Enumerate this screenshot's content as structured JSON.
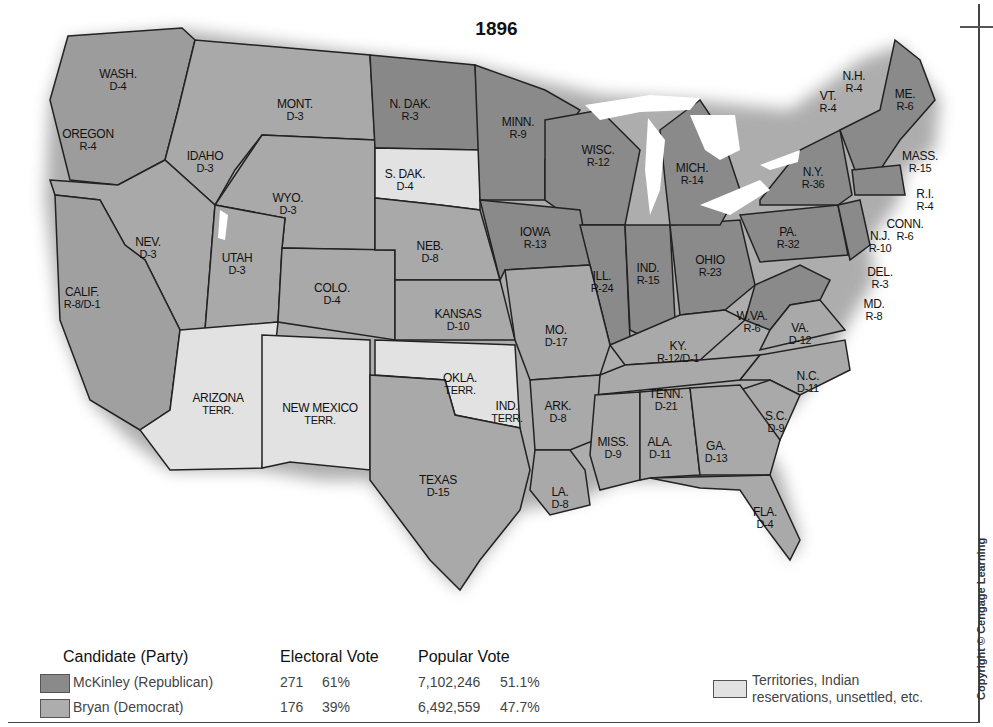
{
  "title": "1896",
  "colors": {
    "republican": "#8a8a8a",
    "democrat": "#adadad",
    "territory": "#e2e2e2",
    "lakes": "#ffffff"
  },
  "states": [
    {
      "name": "WASH.",
      "vote": "D-4",
      "x": 118,
      "y": 68
    },
    {
      "name": "OREGON",
      "vote": "R-4",
      "x": 88,
      "y": 128
    },
    {
      "name": "IDAHO",
      "vote": "D-3",
      "x": 205,
      "y": 150
    },
    {
      "name": "MONT.",
      "vote": "D-3",
      "x": 295,
      "y": 98
    },
    {
      "name": "WYO.",
      "vote": "D-3",
      "x": 288,
      "y": 192
    },
    {
      "name": "N. DAK.",
      "vote": "R-3",
      "x": 410,
      "y": 98
    },
    {
      "name": "S. DAK.",
      "vote": "D-4",
      "x": 405,
      "y": 168
    },
    {
      "name": "MINN.",
      "vote": "R-9",
      "x": 518,
      "y": 116
    },
    {
      "name": "WISC.",
      "vote": "R-12",
      "x": 598,
      "y": 144
    },
    {
      "name": "MICH.",
      "vote": "R-14",
      "x": 692,
      "y": 162
    },
    {
      "name": "NEV.",
      "vote": "D-3",
      "x": 148,
      "y": 236
    },
    {
      "name": "UTAH",
      "vote": "D-3",
      "x": 237,
      "y": 252
    },
    {
      "name": "COLO.",
      "vote": "D-4",
      "x": 332,
      "y": 282
    },
    {
      "name": "NEB.",
      "vote": "D-8",
      "x": 430,
      "y": 240
    },
    {
      "name": "IOWA",
      "vote": "R-13",
      "x": 535,
      "y": 226
    },
    {
      "name": "ILL.",
      "vote": "R-24",
      "x": 602,
      "y": 270
    },
    {
      "name": "IND.",
      "vote": "R-15",
      "x": 648,
      "y": 262
    },
    {
      "name": "OHIO",
      "vote": "R-23",
      "x": 710,
      "y": 254
    },
    {
      "name": "PA.",
      "vote": "R-32",
      "x": 788,
      "y": 226
    },
    {
      "name": "N.Y.",
      "vote": "R-36",
      "x": 813,
      "y": 166
    },
    {
      "name": "CALIF.",
      "vote": "R-8/D-1",
      "x": 82,
      "y": 286
    },
    {
      "name": "KANSAS",
      "vote": "D-10",
      "x": 458,
      "y": 308
    },
    {
      "name": "MO.",
      "vote": "D-17",
      "x": 556,
      "y": 324
    },
    {
      "name": "KY.",
      "vote": "R-12/D-1",
      "x": 678,
      "y": 340
    },
    {
      "name": "W.VA.",
      "vote": "R-6",
      "x": 752,
      "y": 310
    },
    {
      "name": "VA.",
      "vote": "D-12",
      "x": 800,
      "y": 322
    },
    {
      "name": "TENN.",
      "vote": "D-21",
      "x": 666,
      "y": 388
    },
    {
      "name": "N.C.",
      "vote": "D-11",
      "x": 808,
      "y": 370
    },
    {
      "name": "S.C.",
      "vote": "D-9",
      "x": 776,
      "y": 410
    },
    {
      "name": "ARIZONA",
      "vote": "TERR.",
      "x": 218,
      "y": 392
    },
    {
      "name": "NEW MEXICO",
      "vote": "TERR.",
      "x": 320,
      "y": 402
    },
    {
      "name": "OKLA.",
      "vote": "TERR.",
      "x": 460,
      "y": 372
    },
    {
      "name": "IND.",
      "vote": "TERR.",
      "x": 507,
      "y": 400
    },
    {
      "name": "ARK.",
      "vote": "D-8",
      "x": 558,
      "y": 400
    },
    {
      "name": "MISS.",
      "vote": "D-9",
      "x": 613,
      "y": 436
    },
    {
      "name": "ALA.",
      "vote": "D-11",
      "x": 660,
      "y": 436
    },
    {
      "name": "GA.",
      "vote": "D-13",
      "x": 716,
      "y": 440
    },
    {
      "name": "TEXAS",
      "vote": "D-15",
      "x": 438,
      "y": 474
    },
    {
      "name": "LA.",
      "vote": "D-8",
      "x": 560,
      "y": 486
    },
    {
      "name": "FLA.",
      "vote": "D-4",
      "x": 765,
      "y": 506
    }
  ],
  "northeast": [
    {
      "name": "VT.",
      "vote": "R-4",
      "x": 828,
      "y": 90
    },
    {
      "name": "N.H.",
      "vote": "R-4",
      "x": 854,
      "y": 70
    },
    {
      "name": "ME.",
      "vote": "R-6",
      "x": 905,
      "y": 88
    },
    {
      "name": "MASS.",
      "vote": "R-15",
      "x": 920,
      "y": 150
    },
    {
      "name": "R.I.",
      "vote": "R-4",
      "x": 925,
      "y": 188
    },
    {
      "name": "CONN.",
      "vote": "R-6",
      "x": 905,
      "y": 218
    },
    {
      "name": "N.J.",
      "vote": "R-10",
      "x": 880,
      "y": 230
    },
    {
      "name": "DEL.",
      "vote": "R-3",
      "x": 880,
      "y": 266
    },
    {
      "name": "MD.",
      "vote": "R-8",
      "x": 874,
      "y": 298
    }
  ],
  "legend": {
    "candidate_header": "Candidate (Party)",
    "electoral_header": "Electoral Vote",
    "popular_header": "Popular Vote",
    "rows": [
      {
        "candidate": "McKinley (Republican)",
        "ev": "271",
        "ev_pct": "61%",
        "pv": "7,102,246",
        "pv_pct": "51.1%"
      },
      {
        "candidate": "Bryan (Democrat)",
        "ev": "176",
        "ev_pct": "39%",
        "pv": "6,492,559",
        "pv_pct": "47.7%"
      }
    ],
    "territories_line1": "Territories, Indian",
    "territories_line2": "reservations, unsettled, etc."
  },
  "copyright": "Copyright © Cengage Learning"
}
